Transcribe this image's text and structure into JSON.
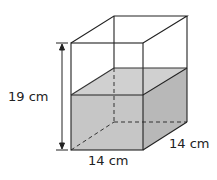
{
  "diagram": {
    "height_label": "19 cm",
    "width_label": "14 cm",
    "depth_label": "14 cm",
    "colors": {
      "water": "#c8c8c8",
      "water_side": "#b9b9b9",
      "water_top": "#d2d2d2",
      "edge": "#222222"
    }
  }
}
